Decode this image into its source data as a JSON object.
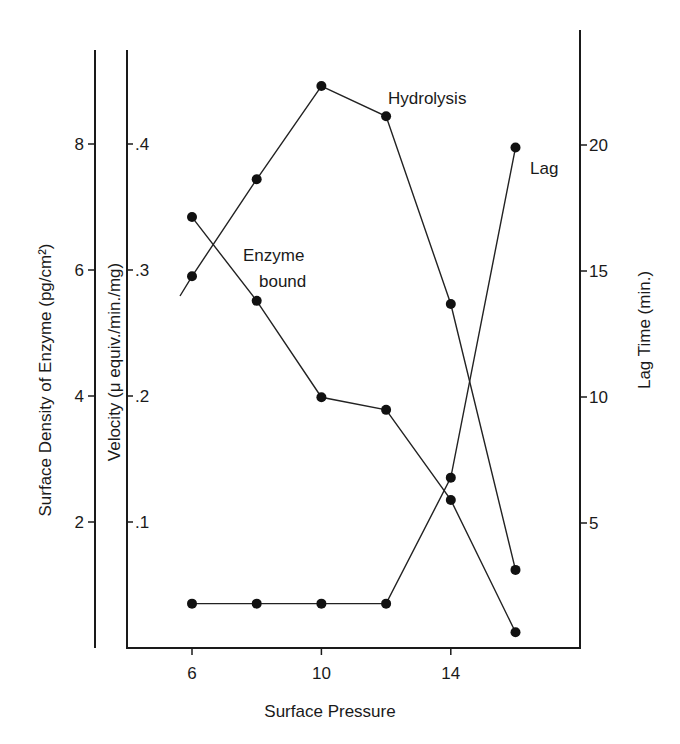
{
  "chart_data": {
    "type": "line",
    "title": "",
    "xlabel": "Surface Pressure",
    "ylabel_left_outer": "Surface Density of Enzyme (pg/cm²)",
    "ylabel_left_inner": "Velocity (μ equiv./min./mg)",
    "ylabel_right": "Lag Time (min.)",
    "x": [
      6,
      8,
      10,
      12,
      14,
      16
    ],
    "x_ticks": [
      "6",
      "10",
      "14"
    ],
    "xlim": [
      4,
      18
    ],
    "y_left_outer_ticks": [
      "2",
      "4",
      "6",
      "8"
    ],
    "y_left_outer_lim": [
      0,
      9.5
    ],
    "y_left_inner_ticks": [
      ".1",
      ".2",
      ".3",
      ".4"
    ],
    "y_left_inner_lim": [
      0,
      0.475
    ],
    "y_right_ticks": [
      "5",
      "10",
      "15",
      "20"
    ],
    "y_right_lim": [
      0,
      24.5
    ],
    "grid": false,
    "legend": "inline labels",
    "series": [
      {
        "name": "Hydrolysis",
        "axis": "Velocity (μ equiv./min./mg)",
        "values": [
          0.295,
          0.372,
          0.446,
          0.422,
          0.273,
          0.062
        ],
        "label_pos": "near x=12 peak"
      },
      {
        "name": "Enzyme bound",
        "axis": "Surface Density of Enzyme (pg/cm²)",
        "values": [
          6.84,
          5.51,
          3.98,
          3.78,
          2.35,
          0.25
        ],
        "label_pos": "near x=8"
      },
      {
        "name": "Lag",
        "axis": "Lag Time (min.)",
        "values": [
          1.8,
          1.8,
          1.8,
          1.8,
          6.8,
          19.9
        ],
        "label_pos": "right of x=16 point"
      }
    ]
  },
  "labels": {
    "xlabel": "Surface Pressure",
    "ylabel_outer": "Surface Density of Enzyme (pg/cm²)",
    "ylabel_inner": "Velocity (μ equiv./min./mg)",
    "ylabel_right": "Lag Time (min.)",
    "series_hydrolysis": "Hydrolysis",
    "series_enzyme_line1": "Enzyme",
    "series_enzyme_line2": "bound",
    "series_lag": "Lag"
  }
}
